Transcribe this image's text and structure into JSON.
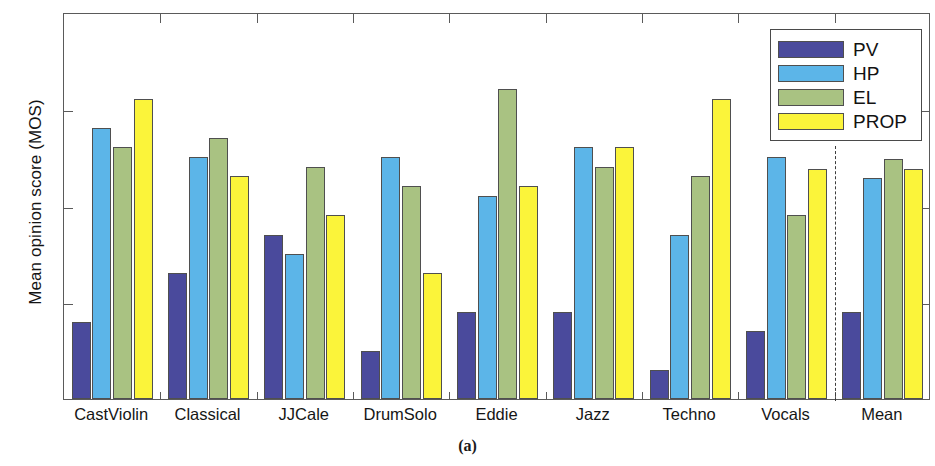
{
  "caption": "(a)",
  "legend": {
    "position": "top-right",
    "entries": [
      {
        "label": "PV",
        "color": "#4a4a9c"
      },
      {
        "label": "HP",
        "color": "#5cb5e8"
      },
      {
        "label": "EL",
        "color": "#a9c282"
      },
      {
        "label": "PROP",
        "color": "#fbf43a"
      }
    ]
  },
  "axes": {
    "ylabel": "Mean opinion score (MOS)",
    "yticks": [
      "1",
      "2",
      "3",
      "4",
      "5"
    ],
    "ytick_values": [
      1,
      2,
      3,
      4,
      5
    ],
    "ymin": 1,
    "ymax": 5,
    "xlabel": ""
  },
  "separator": {
    "after_category": "Vocals",
    "style": "dashed"
  },
  "chart_data": {
    "type": "bar",
    "title": "",
    "subtitle": "",
    "xlabel": "",
    "ylabel": "Mean opinion score (MOS)",
    "ylim": [
      1,
      5
    ],
    "yticks": [
      1,
      2,
      3,
      4,
      5
    ],
    "grid": false,
    "legend_position": "top-right",
    "categories": [
      "CastViolin",
      "Classical",
      "JJCale",
      "DrumSolo",
      "Eddie",
      "Jazz",
      "Techno",
      "Vocals",
      "Mean"
    ],
    "series": [
      {
        "name": "PV",
        "color": "#4a4a9c",
        "values": [
          1.8,
          2.3,
          2.7,
          1.5,
          1.9,
          1.9,
          1.3,
          1.7,
          1.9
        ]
      },
      {
        "name": "HP",
        "color": "#5cb5e8",
        "values": [
          3.8,
          3.5,
          2.5,
          3.5,
          3.1,
          3.6,
          2.7,
          3.5,
          3.28
        ]
      },
      {
        "name": "EL",
        "color": "#a9c282",
        "values": [
          3.6,
          3.7,
          3.4,
          3.2,
          4.2,
          3.4,
          3.3,
          2.9,
          3.48
        ]
      },
      {
        "name": "PROP",
        "color": "#fbf43a",
        "values": [
          4.1,
          3.3,
          2.9,
          2.3,
          3.2,
          3.6,
          4.1,
          3.38,
          3.38
        ]
      }
    ],
    "annotations": [
      {
        "type": "vertical-dashed-line",
        "after_category": "Vocals"
      }
    ]
  }
}
